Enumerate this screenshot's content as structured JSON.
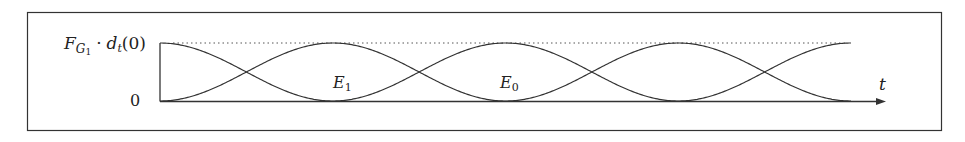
{
  "chart_data": {
    "type": "line",
    "title": "",
    "xlabel": "t",
    "ylabel": "",
    "y_ticks": [
      {
        "label": "F_{G1} · d_t(0)",
        "value": 1
      },
      {
        "label": "0",
        "value": 0
      }
    ],
    "ylim": [
      0,
      1
    ],
    "reference_line": {
      "y": 1,
      "style": "dotted"
    },
    "series": [
      {
        "name": "falling-first",
        "description": "starts at max, cos^2-shaped oscillation",
        "x_half_periods": [
          0,
          1,
          2,
          3,
          4
        ],
        "values": [
          1,
          0,
          1,
          0,
          1
        ]
      },
      {
        "name": "rising-first",
        "description": "starts at 0, sin^2-shaped oscillation",
        "x_half_periods": [
          0,
          1,
          2,
          3,
          4
        ],
        "values": [
          0,
          1,
          0,
          1,
          0
        ]
      }
    ],
    "annotations": [
      {
        "text": "E_1",
        "at_half_period": 1
      },
      {
        "text": "E_0",
        "at_half_period": 2
      }
    ],
    "grid": false,
    "legend": "none"
  },
  "labels": {
    "top_level_main": "F",
    "top_level_sub": "G",
    "top_level_subsub": "1",
    "top_level_rest_dot": "·",
    "top_level_d": "d",
    "top_level_d_sub": "t",
    "top_level_paren": "(0)",
    "zero": "0",
    "axis_t": "t",
    "e1_main": "E",
    "e1_sub": "1",
    "e0_main": "E",
    "e0_sub": "0"
  },
  "geometry": {
    "x0": 160,
    "x_end": 851,
    "y_top": 43,
    "y_zero": 101,
    "half_period_px": 172.75
  }
}
